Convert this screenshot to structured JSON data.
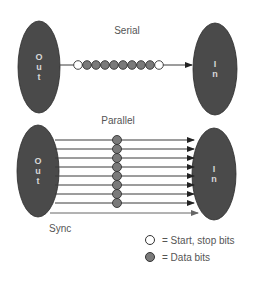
{
  "colors": {
    "node_fill": "#4a4a4a",
    "node_text": "#d8d8d8",
    "line": "#3a3a3a",
    "sync_line": "#666666",
    "data_bit": "#7a7a7a",
    "data_bit_stroke": "#333333",
    "start_stop_bit": "#ffffff",
    "label": "#555555"
  },
  "serial": {
    "title": "Serial",
    "out_node": {
      "label_chars": [
        "O",
        "u",
        "t"
      ],
      "cx": 39,
      "cy": 67,
      "rx": 21,
      "ry": 46
    },
    "in_node": {
      "label_chars": [
        "I",
        "n"
      ],
      "cx": 215,
      "cy": 69,
      "rx": 22,
      "ry": 46
    },
    "line": {
      "x1": 60,
      "x2": 192,
      "y": 65
    },
    "bits": [
      "start",
      "data",
      "data",
      "data",
      "data",
      "data",
      "data",
      "data",
      "data",
      "stop"
    ],
    "bits_start_x": 78,
    "bit_spacing": 9,
    "bit_radius": 4.3
  },
  "parallel": {
    "title": "Parallel",
    "out_node": {
      "label_chars": [
        "O",
        "u",
        "t"
      ],
      "cx": 38,
      "cy": 171,
      "rx": 21,
      "ry": 46
    },
    "in_node": {
      "label_chars": [
        "I",
        "n"
      ],
      "cx": 214,
      "cy": 174,
      "rx": 22,
      "ry": 46
    },
    "data_lines_y": [
      140,
      149,
      158,
      167,
      176,
      185,
      194,
      203
    ],
    "line_x1": 55,
    "line_x2": 194,
    "bit_x": 117,
    "bit_radius": 4.5,
    "sync": {
      "label": "Sync",
      "y": 213,
      "x1": 50,
      "x2": 198
    }
  },
  "legend": {
    "items": [
      {
        "type": "start_stop",
        "text": "= Start, stop bits"
      },
      {
        "type": "data",
        "text": "= Data bits"
      }
    ]
  }
}
